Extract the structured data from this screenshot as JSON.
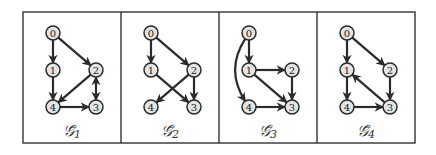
{
  "figure": {
    "panels": [
      {
        "id": "G1",
        "label": "𝒢̄",
        "subscript": "1",
        "nodes": [
          {
            "id": "0",
            "x": 0,
            "y": 0
          },
          {
            "id": "1",
            "x": 0,
            "y": 37
          },
          {
            "id": "2",
            "x": 43,
            "y": 37
          },
          {
            "id": "3",
            "x": 43,
            "y": 74
          },
          {
            "id": "4",
            "x": 0,
            "y": 74
          }
        ],
        "edges": [
          {
            "from": "0",
            "to": "1",
            "bidirectional": false
          },
          {
            "from": "0",
            "to": "2",
            "bidirectional": false
          },
          {
            "from": "1",
            "to": "4",
            "bidirectional": false
          },
          {
            "from": "2",
            "to": "4",
            "bidirectional": false
          },
          {
            "from": "4",
            "to": "3",
            "bidirectional": false
          },
          {
            "from": "2",
            "to": "3",
            "bidirectional": true
          }
        ]
      },
      {
        "id": "G2",
        "label": "𝒢̄",
        "subscript": "2",
        "nodes": [
          {
            "id": "0",
            "x": 0,
            "y": 0
          },
          {
            "id": "1",
            "x": 0,
            "y": 37
          },
          {
            "id": "2",
            "x": 43,
            "y": 37
          },
          {
            "id": "3",
            "x": 43,
            "y": 74
          },
          {
            "id": "4",
            "x": 0,
            "y": 74
          }
        ],
        "edges": [
          {
            "from": "0",
            "to": "1",
            "bidirectional": false
          },
          {
            "from": "0",
            "to": "2",
            "bidirectional": false
          },
          {
            "from": "1",
            "to": "3",
            "bidirectional": false
          },
          {
            "from": "2",
            "to": "4",
            "bidirectional": false
          },
          {
            "from": "2",
            "to": "3",
            "bidirectional": false
          }
        ]
      },
      {
        "id": "G3",
        "label": "𝒢̄",
        "subscript": "3",
        "nodes": [
          {
            "id": "0",
            "x": 0,
            "y": 0
          },
          {
            "id": "1",
            "x": 0,
            "y": 37
          },
          {
            "id": "2",
            "x": 43,
            "y": 37
          },
          {
            "id": "3",
            "x": 43,
            "y": 74
          },
          {
            "id": "4",
            "x": 0,
            "y": 74
          }
        ],
        "edges": [
          {
            "from": "0",
            "to": "1",
            "bidirectional": false
          },
          {
            "from": "0",
            "to": "4",
            "bidirectional": false,
            "curved": true
          },
          {
            "from": "1",
            "to": "2",
            "bidirectional": false
          },
          {
            "from": "1",
            "to": "3",
            "bidirectional": false
          },
          {
            "from": "2",
            "to": "3",
            "bidirectional": false
          },
          {
            "from": "4",
            "to": "3",
            "bidirectional": false
          }
        ]
      },
      {
        "id": "G4",
        "label": "𝒢̄",
        "subscript": "4",
        "nodes": [
          {
            "id": "0",
            "x": 0,
            "y": 0
          },
          {
            "id": "1",
            "x": 0,
            "y": 37
          },
          {
            "id": "2",
            "x": 43,
            "y": 37
          },
          {
            "id": "3",
            "x": 43,
            "y": 74
          },
          {
            "id": "4",
            "x": 0,
            "y": 74
          }
        ],
        "edges": [
          {
            "from": "0",
            "to": "1",
            "bidirectional": false
          },
          {
            "from": "0",
            "to": "2",
            "bidirectional": false
          },
          {
            "from": "1",
            "to": "4",
            "bidirectional": false
          },
          {
            "from": "2",
            "to": "3",
            "bidirectional": false
          },
          {
            "from": "4",
            "to": "3",
            "bidirectional": false
          },
          {
            "from": "3",
            "to": "1",
            "bidirectional": false
          }
        ]
      }
    ],
    "colors": {
      "node_fill": "#e4e4e4",
      "stroke": "#2b2b2b",
      "frame": "#333333"
    }
  }
}
